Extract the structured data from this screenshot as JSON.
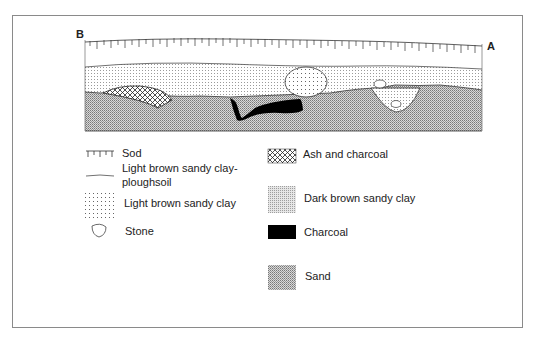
{
  "figure": {
    "section_end_left": "B",
    "section_end_right": "A"
  },
  "legend": {
    "left": [
      {
        "key": "sod",
        "label": "Sod"
      },
      {
        "key": "ploughsoil",
        "label_line1": "Light brown sandy clay-",
        "label_line2": "ploughsoil"
      },
      {
        "key": "light_brown",
        "label": "Light brown sandy clay"
      },
      {
        "key": "stone",
        "label": "Stone"
      }
    ],
    "right": [
      {
        "key": "ash",
        "label": "Ash and charcoal"
      },
      {
        "key": "dark_brown",
        "label": "Dark brown sandy clay"
      },
      {
        "key": "charcoal",
        "label": "Charcoal"
      },
      {
        "key": "sand",
        "label": "Sand"
      }
    ]
  },
  "colors": {
    "frame": "#8a8a8a",
    "ink": "#111111",
    "charcoal": "#000000"
  }
}
